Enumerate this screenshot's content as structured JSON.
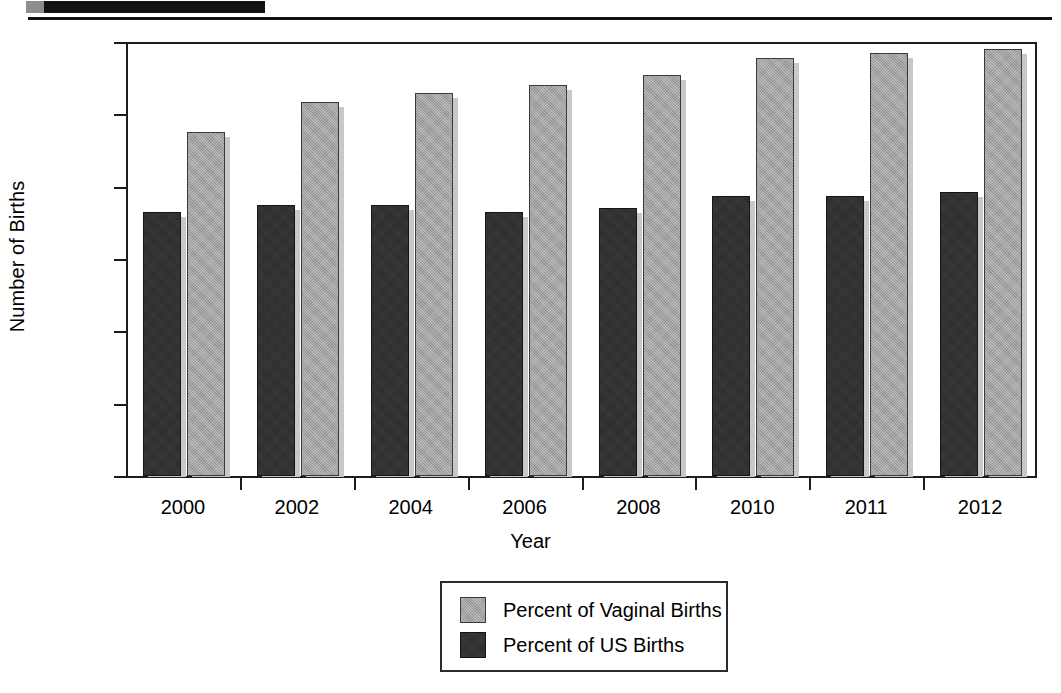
{
  "document": {
    "redaction_bar": "",
    "header_rule": ""
  },
  "chart_data": {
    "type": "bar",
    "title": "",
    "xlabel": "Year",
    "ylabel": "Number of Births",
    "categories": [
      "2000",
      "2002",
      "2004",
      "2006",
      "2008",
      "2010",
      "2011",
      "2012"
    ],
    "series": [
      {
        "name": "Percent of US Births",
        "color": "#2b2b2b",
        "values": [
          7.3,
          7.5,
          7.5,
          7.3,
          7.4,
          7.75,
          7.75,
          7.85
        ]
      },
      {
        "name": "Percent of Vaginal Births",
        "color": "#a2a2a2",
        "values": [
          9.5,
          10.35,
          10.6,
          10.8,
          11.1,
          11.55,
          11.7,
          11.8
        ]
      }
    ],
    "ylim": [
      0,
      12
    ],
    "ytick_labels": [
      "12%",
      "10%",
      "8%",
      "6%",
      "4%",
      "2%",
      "0"
    ],
    "ytick_values": [
      12,
      10,
      8,
      6,
      4,
      2,
      0
    ],
    "grid": false,
    "legend_position": "bottom-center",
    "legend_entries": [
      {
        "label": "Percent of Vaginal Births",
        "color": "#a2a2a2"
      },
      {
        "label": "Percent of US Births",
        "color": "#2b2b2b"
      }
    ]
  }
}
